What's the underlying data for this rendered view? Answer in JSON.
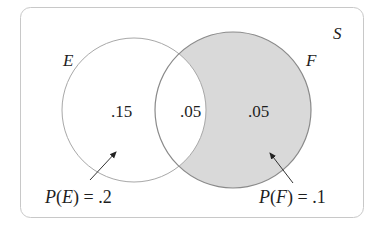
{
  "diagram": {
    "type": "venn",
    "universe_label": "S",
    "sets": [
      {
        "name": "E",
        "label": "E"
      },
      {
        "name": "F",
        "label": "F"
      }
    ],
    "regions": {
      "e_only": ".15",
      "intersection": ".05",
      "f_only": ".05"
    },
    "annotations": {
      "pe": {
        "prefix": "P(",
        "set": "E",
        "suffix": ") = .2"
      },
      "pf": {
        "prefix": "P(",
        "set": "F",
        "suffix": ") = .1"
      }
    },
    "colors": {
      "shade": "#d9d9d9",
      "stroke": "#8a8a8a",
      "frame": "#c8c8c8"
    }
  }
}
